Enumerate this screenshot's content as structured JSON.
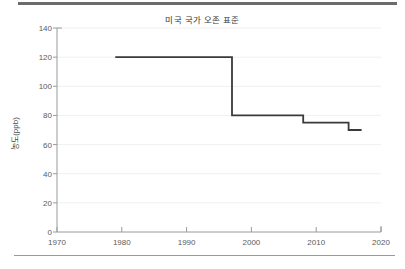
{
  "figure": {
    "title": "미국 국가 오존 표준",
    "ylabel": "농도(ppb)",
    "xlabel": "",
    "line_color": "#3a3a3a",
    "grid_color": "#f0f0f0",
    "axis_color": "#9a9a9a",
    "text_color": "#5a5a5a",
    "background": "#ffffff"
  },
  "decor": {
    "top_rule_label": "top-divider",
    "bottom_rule_label": "bottom-divider"
  },
  "chart_data": {
    "type": "line",
    "title": "미국 국가 오존 표준",
    "xlabel": "",
    "ylabel": "농도(ppb)",
    "xlim": [
      1970,
      2020
    ],
    "ylim": [
      0,
      140
    ],
    "xticks": [
      1970,
      1980,
      1990,
      2000,
      2010,
      2020
    ],
    "xtick_labels": [
      "1970",
      "1980",
      "1990",
      "2000",
      "2010",
      "2020"
    ],
    "yticks": [
      0,
      20,
      40,
      60,
      80,
      100,
      120,
      140
    ],
    "ytick_labels": [
      "0",
      "20",
      "40",
      "60",
      "80",
      "100",
      "120",
      "140"
    ],
    "grid": true,
    "grid_axis": "y",
    "legend": false,
    "drawstyle": "steps-post",
    "series": [
      {
        "name": "미국 국가 오존 표준",
        "x": [
          1979,
          1997,
          2008,
          2015,
          2017
        ],
        "y": [
          120,
          80,
          75,
          70,
          70
        ]
      }
    ],
    "steps": [
      {
        "start": 1979,
        "end": 1997,
        "value": 120
      },
      {
        "start": 1997,
        "end": 2008,
        "value": 80
      },
      {
        "start": 2008,
        "end": 2015,
        "value": 75
      },
      {
        "start": 2015,
        "end": 2017,
        "value": 70
      }
    ]
  }
}
